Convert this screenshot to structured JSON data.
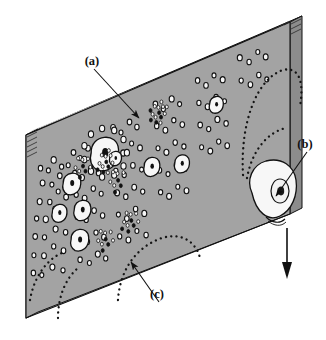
{
  "figure": {
    "type": "technical-line-diagram",
    "background_color": "#ffffff",
    "plate_face_color": "#a3a3a3",
    "plate_edge_color": "#8a8a8a",
    "plate_edge_dark_color": "#6f6f6f",
    "outline_color": "#111111",
    "bubble_fill_color": "#f7f7f7",
    "nucleus_color": "#111111"
  },
  "labels": [
    {
      "id": "a",
      "text": "(a)",
      "x": 92,
      "y": 65,
      "leader_to_x": 139,
      "leader_to_y": 118,
      "arrow": true,
      "desc": "large growing bubble ringed by small nucleation sites"
    },
    {
      "id": "b",
      "text": "(b)",
      "x": 305,
      "y": 148,
      "leader_to_x": 276,
      "leader_to_y": 196,
      "arrow": true,
      "desc": "large bubble departing from the right edge of the plate"
    },
    {
      "id": "c",
      "text": "(c)",
      "x": 157,
      "y": 298,
      "leader_to_x": 131,
      "leader_to_y": 262,
      "arrow": true,
      "desc": "cluster of fine dots marking active nucleation sites"
    }
  ],
  "departure_arrow": {
    "name": "bubble-departure-arrow",
    "direction": "down",
    "x": 287,
    "y_start": 228,
    "y_end": 278
  },
  "plate_geometry": {
    "front_top_left": [
      26,
      135
    ],
    "front_top_right": [
      290,
      22
    ],
    "front_bottom_right": [
      290,
      214
    ],
    "front_bottom_left": [
      26,
      318
    ],
    "thickness_dx": 12,
    "thickness_dy": -6
  },
  "surface_features": {
    "small_circles_count": 118,
    "large_bubbles_count": 9,
    "dot_clusters_count": 6,
    "dotted_curves_count": 5
  },
  "chart_data": {
    "type": "scatter",
    "title": "",
    "xlabel": "",
    "ylabel": "",
    "note": "positions are plate-local unit coordinates u (left-to-right) and v (top-to-bottom) on the plate face",
    "series": [
      {
        "name": "small-bubbles",
        "marker": "open-circle",
        "points": [
          [
            0.055,
            0.215,
            2.2
          ],
          [
            0.085,
            0.245,
            2.0
          ],
          [
            0.105,
            0.2,
            2.6
          ],
          [
            0.135,
            0.255,
            2.1
          ],
          [
            0.063,
            0.3,
            2.4
          ],
          [
            0.098,
            0.33,
            2.0
          ],
          [
            0.128,
            0.3,
            2.3
          ],
          [
            0.16,
            0.262,
            2.0
          ],
          [
            0.052,
            0.395,
            2.5
          ],
          [
            0.09,
            0.42,
            2.2
          ],
          [
            0.122,
            0.382,
            2.0
          ],
          [
            0.152,
            0.43,
            2.4
          ],
          [
            0.04,
            0.48,
            2.1
          ],
          [
            0.075,
            0.505,
            2.6
          ],
          [
            0.11,
            0.47,
            2.2
          ],
          [
            0.145,
            0.52,
            2.0
          ],
          [
            0.035,
            0.575,
            2.3
          ],
          [
            0.07,
            0.6,
            2.1
          ],
          [
            0.112,
            0.58,
            2.5
          ],
          [
            0.15,
            0.62,
            2.2
          ],
          [
            0.03,
            0.675,
            2.0
          ],
          [
            0.068,
            0.7,
            2.4
          ],
          [
            0.105,
            0.67,
            2.1
          ],
          [
            0.142,
            0.715,
            2.3
          ],
          [
            0.028,
            0.77,
            2.2
          ],
          [
            0.06,
            0.8,
            2.0
          ],
          [
            0.1,
            0.78,
            2.5
          ],
          [
            0.14,
            0.82,
            2.1
          ],
          [
            0.18,
            0.205,
            2.3
          ],
          [
            0.205,
            0.25,
            2.0
          ],
          [
            0.235,
            0.215,
            2.4
          ],
          [
            0.262,
            0.26,
            2.1
          ],
          [
            0.185,
            0.32,
            2.2
          ],
          [
            0.212,
            0.36,
            2.5
          ],
          [
            0.245,
            0.33,
            2.0
          ],
          [
            0.275,
            0.372,
            2.3
          ],
          [
            0.19,
            0.44,
            2.1
          ],
          [
            0.222,
            0.478,
            2.4
          ],
          [
            0.255,
            0.445,
            2.2
          ],
          [
            0.285,
            0.49,
            2.0
          ],
          [
            0.195,
            0.56,
            2.5
          ],
          [
            0.228,
            0.598,
            2.1
          ],
          [
            0.258,
            0.565,
            2.3
          ],
          [
            0.29,
            0.61,
            2.2
          ],
          [
            0.2,
            0.68,
            2.0
          ],
          [
            0.232,
            0.718,
            2.4
          ],
          [
            0.265,
            0.688,
            2.1
          ],
          [
            0.295,
            0.73,
            2.3
          ],
          [
            0.205,
            0.8,
            2.2
          ],
          [
            0.24,
            0.838,
            2.0
          ],
          [
            0.272,
            0.808,
            2.5
          ],
          [
            0.302,
            0.848,
            2.1
          ],
          [
            0.33,
            0.16,
            2.4
          ],
          [
            0.36,
            0.205,
            2.0
          ],
          [
            0.392,
            0.168,
            2.3
          ],
          [
            0.42,
            0.212,
            2.2
          ],
          [
            0.335,
            0.28,
            2.1
          ],
          [
            0.368,
            0.32,
            2.5
          ],
          [
            0.4,
            0.288,
            2.0
          ],
          [
            0.432,
            0.33,
            2.4
          ],
          [
            0.34,
            0.4,
            2.2
          ],
          [
            0.372,
            0.44,
            2.1
          ],
          [
            0.405,
            0.408,
            2.3
          ],
          [
            0.438,
            0.45,
            2.0
          ],
          [
            0.345,
            0.52,
            2.5
          ],
          [
            0.378,
            0.56,
            2.2
          ],
          [
            0.41,
            0.528,
            2.4
          ],
          [
            0.442,
            0.57,
            2.1
          ],
          [
            0.35,
            0.64,
            2.0
          ],
          [
            0.382,
            0.68,
            2.3
          ],
          [
            0.415,
            0.648,
            2.2
          ],
          [
            0.448,
            0.69,
            2.5
          ],
          [
            0.355,
            0.76,
            2.1
          ],
          [
            0.388,
            0.798,
            2.4
          ],
          [
            0.42,
            0.768,
            2.0
          ],
          [
            0.455,
            0.81,
            2.2
          ],
          [
            0.49,
            0.13,
            2.3
          ],
          [
            0.52,
            0.175,
            2.1
          ],
          [
            0.552,
            0.14,
            2.5
          ],
          [
            0.582,
            0.185,
            2.0
          ],
          [
            0.495,
            0.25,
            2.2
          ],
          [
            0.528,
            0.292,
            2.4
          ],
          [
            0.56,
            0.258,
            2.1
          ],
          [
            0.592,
            0.3,
            2.3
          ],
          [
            0.5,
            0.372,
            2.0
          ],
          [
            0.532,
            0.412,
            2.5
          ],
          [
            0.565,
            0.38,
            2.2
          ],
          [
            0.598,
            0.42,
            2.1
          ],
          [
            0.505,
            0.492,
            2.4
          ],
          [
            0.538,
            0.532,
            2.0
          ],
          [
            0.57,
            0.5,
            2.3
          ],
          [
            0.602,
            0.54,
            2.2
          ],
          [
            0.51,
            0.612,
            2.1
          ],
          [
            0.542,
            0.652,
            2.5
          ],
          [
            0.575,
            0.62,
            2.0
          ],
          [
            0.608,
            0.66,
            2.4
          ],
          [
            0.65,
            0.1,
            2.2
          ],
          [
            0.682,
            0.145,
            2.3
          ],
          [
            0.712,
            0.11,
            2.0
          ],
          [
            0.745,
            0.152,
            2.5
          ],
          [
            0.655,
            0.222,
            2.1
          ],
          [
            0.688,
            0.262,
            2.4
          ],
          [
            0.72,
            0.23,
            2.2
          ],
          [
            0.752,
            0.27,
            2.0
          ],
          [
            0.66,
            0.342,
            2.3
          ],
          [
            0.692,
            0.382,
            2.1
          ],
          [
            0.725,
            0.35,
            2.5
          ],
          [
            0.758,
            0.39,
            2.2
          ],
          [
            0.665,
            0.462,
            2.0
          ],
          [
            0.698,
            0.502,
            2.4
          ],
          [
            0.73,
            0.47,
            2.1
          ],
          [
            0.762,
            0.51,
            2.3
          ],
          [
            0.81,
            0.075,
            2.5
          ],
          [
            0.845,
            0.118,
            2.2
          ],
          [
            0.878,
            0.085,
            2.0
          ],
          [
            0.908,
            0.128,
            2.4
          ],
          [
            0.815,
            0.198,
            2.1
          ],
          [
            0.85,
            0.24,
            2.3
          ],
          [
            0.882,
            0.208,
            2.2
          ],
          [
            0.912,
            0.248,
            2.0
          ]
        ]
      },
      {
        "name": "large-bubbles",
        "marker": "filled-blob-with-nucleus",
        "points": [
          [
            0.175,
            0.368,
            9.0
          ],
          [
            0.128,
            0.5,
            7.5
          ],
          [
            0.215,
            0.535,
            8.5
          ],
          [
            0.3,
            0.278,
            14.0
          ],
          [
            0.34,
            0.33,
            6.0
          ],
          [
            0.478,
            0.455,
            8.0
          ],
          [
            0.592,
            0.505,
            7.5
          ],
          [
            0.722,
            0.268,
            7.0
          ],
          [
            0.205,
            0.69,
            9.0
          ]
        ]
      },
      {
        "name": "dot-clusters",
        "marker": "fine-dot-swarm",
        "points": [
          [
            0.212,
            0.3,
            9
          ],
          [
            0.3,
            0.33,
            12
          ],
          [
            0.345,
            0.455,
            8
          ],
          [
            0.5,
            0.185,
            14
          ],
          [
            0.395,
            0.7,
            10
          ],
          [
            0.298,
            0.745,
            9
          ]
        ]
      }
    ]
  }
}
